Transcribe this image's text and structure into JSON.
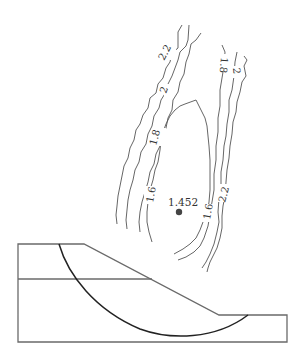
{
  "diagram": {
    "critical_center": {
      "label": "1.452",
      "x": 179,
      "y": 212
    },
    "contour_labels": [
      {
        "id": "left-2.2",
        "text": "2.2"
      },
      {
        "id": "left-2",
        "text": "2"
      },
      {
        "id": "left-1.8",
        "text": "1.8"
      },
      {
        "id": "left-1.6",
        "text": "1.6"
      },
      {
        "id": "right-1.6",
        "text": "1.6"
      },
      {
        "id": "right-1.8",
        "text": "1.8"
      },
      {
        "id": "right-2",
        "text": "2"
      },
      {
        "id": "right-2.2",
        "text": "2.2"
      }
    ],
    "colors": {
      "contour": "#555555",
      "outline": "#6a6a6a",
      "slip_surface": "#222222",
      "center_point": "#444444"
    }
  }
}
